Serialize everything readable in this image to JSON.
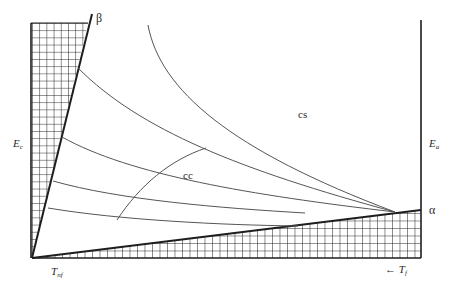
{
  "diagram": {
    "labels": {
      "beta": "β",
      "alpha": "α",
      "cs": "cs",
      "cc": "cc",
      "Ec_main": "E",
      "Ec_sub": "c",
      "Ea_main": "E",
      "Ea_sub": "a",
      "Tnf_main": "T",
      "Tnf_sub": "nf",
      "Tf_arrow": "←",
      "Tf_main": "T",
      "Tf_sub": "f"
    },
    "colors": {
      "line": "#2a2a2a",
      "curve": "#555555",
      "grid": "#1e1e1e",
      "background": "#ffffff"
    }
  }
}
